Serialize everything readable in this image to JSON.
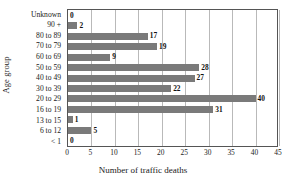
{
  "chart_data": {
    "type": "bar",
    "orientation": "horizontal",
    "title": "",
    "xlabel": "Number of traffic deaths",
    "ylabel": "Age group",
    "categories": [
      "Unknown",
      "90 +",
      "80 to 89",
      "70 to 79",
      "60 to 69",
      "50 to 59",
      "40 to 49",
      "30 to 39",
      "20 to 29",
      "16 to 19",
      "13 to 15",
      "6 to 12",
      "< 1"
    ],
    "values": [
      0,
      2,
      17,
      19,
      9,
      28,
      27,
      22,
      40,
      31,
      1,
      5,
      0
    ],
    "xlim": [
      0,
      45
    ],
    "xticks": [
      0,
      5,
      10,
      15,
      20,
      25,
      30,
      35,
      40,
      45
    ],
    "xtick_labels": [
      "0",
      "5",
      "10",
      "15",
      "20",
      "25",
      "30",
      "35",
      "40",
      "45"
    ],
    "grid": "vertical",
    "legend": "none",
    "bar_color": "#7a7a7a",
    "grid_color": "#b9b9b9",
    "axis_color": "#555555",
    "value_labels": [
      "0",
      "2",
      "17",
      "19",
      "9",
      "28",
      "27",
      "22",
      "40",
      "31",
      "1",
      "5",
      "0"
    ]
  }
}
